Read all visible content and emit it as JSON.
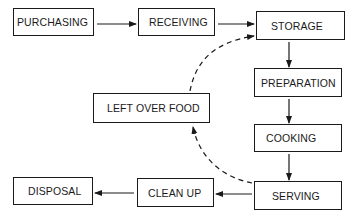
{
  "diagram": {
    "nodes": [
      {
        "id": "purchasing",
        "label": "PURCHASING"
      },
      {
        "id": "receiving",
        "label": "RECEIVING"
      },
      {
        "id": "storage",
        "label": "STORAGE"
      },
      {
        "id": "preparation",
        "label": "PREPARATION"
      },
      {
        "id": "left_over_food",
        "label": "LEFT OVER FOOD"
      },
      {
        "id": "cooking",
        "label": "COOKING"
      },
      {
        "id": "serving",
        "label": "SERVING"
      },
      {
        "id": "clean_up",
        "label": "CLEAN UP"
      },
      {
        "id": "disposal",
        "label": "DISPOSAL"
      }
    ],
    "edges": [
      {
        "from": "purchasing",
        "to": "receiving",
        "style": "solid"
      },
      {
        "from": "receiving",
        "to": "storage",
        "style": "solid"
      },
      {
        "from": "storage",
        "to": "preparation",
        "style": "solid"
      },
      {
        "from": "preparation",
        "to": "cooking",
        "style": "solid"
      },
      {
        "from": "cooking",
        "to": "serving",
        "style": "solid"
      },
      {
        "from": "serving",
        "to": "clean_up",
        "style": "solid"
      },
      {
        "from": "clean_up",
        "to": "disposal",
        "style": "solid"
      },
      {
        "from": "serving",
        "to": "left_over_food",
        "style": "dashed"
      },
      {
        "from": "left_over_food",
        "to": "storage",
        "style": "dashed"
      }
    ],
    "colors": {
      "line": "#1a1a1a",
      "background": "#ffffff"
    }
  }
}
